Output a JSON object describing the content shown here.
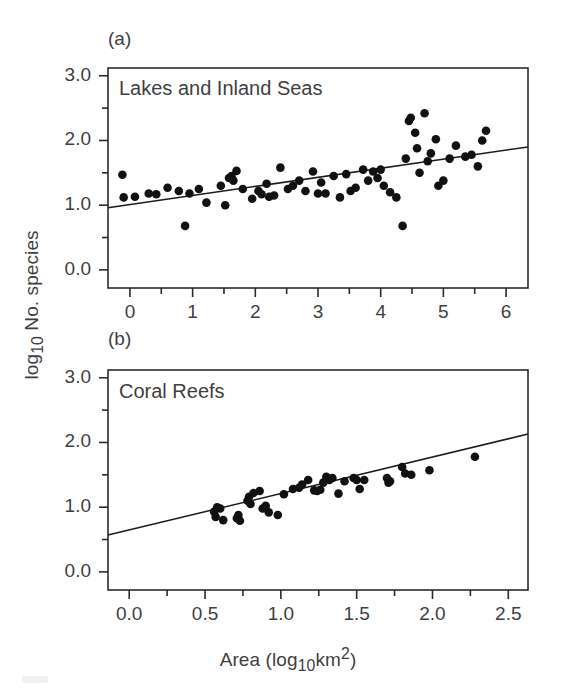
{
  "figure": {
    "axis_titles": {
      "y": "log10 No. species",
      "y_parts": {
        "pre": "log",
        "sub": "10",
        "post": " No. species"
      },
      "x": "Area (log10km2)",
      "x_parts": {
        "pre": "Area (log",
        "sub": "10",
        "mid": "km",
        "sup": "2",
        "post": ")"
      }
    },
    "background_color": "#ffffff",
    "point_color": "#111111",
    "line_color": "#1c1c1c",
    "text_color": "#3f3f3f"
  },
  "chart_data": [
    {
      "type": "scatter",
      "panel_letter": "(a)",
      "title": "Lakes and Inland Seas",
      "xlabel": "",
      "ylabel": "log10 No. species",
      "xlim": [
        -0.35,
        6.35
      ],
      "ylim": [
        -0.28,
        3.12
      ],
      "grid": false,
      "legend": "none",
      "xticks": [
        0,
        1,
        2,
        3,
        4,
        5,
        6
      ],
      "xticklabels": [
        "0",
        "1",
        "2",
        "3",
        "4",
        "5",
        "6"
      ],
      "xminorticks": [
        0.5,
        1.5,
        2.5,
        3.5,
        4.5,
        5.5
      ],
      "yticks": [
        0.0,
        1.0,
        2.0,
        3.0
      ],
      "yticklabels": [
        "0.0",
        "1.0",
        "2.0",
        "3.0"
      ],
      "yminorticks": [
        0.5,
        1.5,
        2.5
      ],
      "fit_line": {
        "x": [
          -0.35,
          6.35
        ],
        "y": [
          0.96,
          1.9
        ],
        "slope": 0.141,
        "intercept": 1.009
      },
      "points": [
        [
          -0.12,
          1.47
        ],
        [
          -0.1,
          1.12
        ],
        [
          0.08,
          1.13
        ],
        [
          0.3,
          1.18
        ],
        [
          0.42,
          1.17
        ],
        [
          0.6,
          1.27
        ],
        [
          0.78,
          1.22
        ],
        [
          0.88,
          0.68
        ],
        [
          0.95,
          1.18
        ],
        [
          1.1,
          1.25
        ],
        [
          1.22,
          1.04
        ],
        [
          1.45,
          1.3
        ],
        [
          1.52,
          1.0
        ],
        [
          1.58,
          1.42
        ],
        [
          1.62,
          1.45
        ],
        [
          1.65,
          1.38
        ],
        [
          1.7,
          1.53
        ],
        [
          1.8,
          1.25
        ],
        [
          1.95,
          1.1
        ],
        [
          2.05,
          1.22
        ],
        [
          2.1,
          1.17
        ],
        [
          2.18,
          1.33
        ],
        [
          2.22,
          1.13
        ],
        [
          2.3,
          1.15
        ],
        [
          2.4,
          1.58
        ],
        [
          2.52,
          1.25
        ],
        [
          2.6,
          1.3
        ],
        [
          2.7,
          1.38
        ],
        [
          2.8,
          1.22
        ],
        [
          2.92,
          1.52
        ],
        [
          3.0,
          1.18
        ],
        [
          3.05,
          1.35
        ],
        [
          3.12,
          1.18
        ],
        [
          3.25,
          1.45
        ],
        [
          3.35,
          1.12
        ],
        [
          3.45,
          1.48
        ],
        [
          3.52,
          1.22
        ],
        [
          3.6,
          1.27
        ],
        [
          3.72,
          1.55
        ],
        [
          3.8,
          1.38
        ],
        [
          3.88,
          1.52
        ],
        [
          3.95,
          1.42
        ],
        [
          4.0,
          1.55
        ],
        [
          4.05,
          1.3
        ],
        [
          4.15,
          1.2
        ],
        [
          4.25,
          1.12
        ],
        [
          4.35,
          0.68
        ],
        [
          4.4,
          1.72
        ],
        [
          4.45,
          2.3
        ],
        [
          4.48,
          2.35
        ],
        [
          4.55,
          2.12
        ],
        [
          4.58,
          1.88
        ],
        [
          4.62,
          1.5
        ],
        [
          4.7,
          2.42
        ],
        [
          4.75,
          1.68
        ],
        [
          4.8,
          1.8
        ],
        [
          4.88,
          2.02
        ],
        [
          4.92,
          1.3
        ],
        [
          5.0,
          1.38
        ],
        [
          5.1,
          1.72
        ],
        [
          5.2,
          1.92
        ],
        [
          5.35,
          1.75
        ],
        [
          5.45,
          1.78
        ],
        [
          5.55,
          1.6
        ],
        [
          5.62,
          2.0
        ],
        [
          5.68,
          2.15
        ]
      ]
    },
    {
      "type": "scatter",
      "panel_letter": "(b)",
      "title": "Coral Reefs",
      "xlabel": "Area (log10km2)",
      "ylabel": "log10 No. species",
      "xlim": [
        -0.14,
        2.63
      ],
      "ylim": [
        -0.28,
        3.12
      ],
      "grid": false,
      "legend": "none",
      "xticks": [
        0.0,
        0.5,
        1.0,
        1.5,
        2.0,
        2.5
      ],
      "xticklabels": [
        "0.0",
        "0.5",
        "1.0",
        "1.5",
        "2.0",
        "2.5"
      ],
      "xminorticks": [
        0.25,
        0.75,
        1.25,
        1.75,
        2.25
      ],
      "yticks": [
        0.0,
        1.0,
        2.0,
        3.0
      ],
      "yticklabels": [
        "0.0",
        "1.0",
        "2.0",
        "3.0"
      ],
      "yminorticks": [
        0.5,
        1.5,
        2.5
      ],
      "fit_line": {
        "x": [
          -0.14,
          2.63
        ],
        "y": [
          0.57,
          2.13
        ],
        "slope": 0.563,
        "intercept": 0.649
      },
      "points": [
        [
          0.56,
          0.93
        ],
        [
          0.57,
          0.85
        ],
        [
          0.58,
          1.0
        ],
        [
          0.6,
          0.98
        ],
        [
          0.62,
          0.8
        ],
        [
          0.71,
          0.83
        ],
        [
          0.72,
          0.88
        ],
        [
          0.73,
          0.79
        ],
        [
          0.78,
          1.1
        ],
        [
          0.79,
          1.16
        ],
        [
          0.8,
          1.05
        ],
        [
          0.82,
          1.22
        ],
        [
          0.86,
          1.25
        ],
        [
          0.88,
          0.98
        ],
        [
          0.9,
          1.02
        ],
        [
          0.92,
          0.92
        ],
        [
          0.98,
          0.88
        ],
        [
          1.02,
          1.2
        ],
        [
          1.08,
          1.28
        ],
        [
          1.12,
          1.3
        ],
        [
          1.14,
          1.35
        ],
        [
          1.18,
          1.42
        ],
        [
          1.22,
          1.26
        ],
        [
          1.24,
          1.25
        ],
        [
          1.26,
          1.27
        ],
        [
          1.28,
          1.38
        ],
        [
          1.3,
          1.47
        ],
        [
          1.32,
          1.42
        ],
        [
          1.34,
          1.45
        ],
        [
          1.38,
          1.21
        ],
        [
          1.42,
          1.4
        ],
        [
          1.48,
          1.45
        ],
        [
          1.5,
          1.42
        ],
        [
          1.52,
          1.28
        ],
        [
          1.55,
          1.42
        ],
        [
          1.7,
          1.45
        ],
        [
          1.71,
          1.38
        ],
        [
          1.72,
          1.4
        ],
        [
          1.8,
          1.62
        ],
        [
          1.82,
          1.52
        ],
        [
          1.86,
          1.5
        ],
        [
          1.98,
          1.57
        ],
        [
          2.28,
          1.78
        ]
      ]
    }
  ]
}
